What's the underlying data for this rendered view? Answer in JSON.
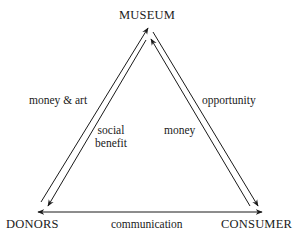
{
  "diagram": {
    "type": "triangle-flow",
    "nodes": {
      "museum": "MUSEUM",
      "donors": "DONORS",
      "consumer": "CONSUMER"
    },
    "edges": [
      {
        "from": "DONORS",
        "to": "MUSEUM",
        "label": "money & art"
      },
      {
        "from": "MUSEUM",
        "to": "DONORS",
        "label_line1": "social",
        "label_line2": "benefit"
      },
      {
        "from": "MUSEUM",
        "to": "CONSUMER",
        "label": "opportunity"
      },
      {
        "from": "CONSUMER",
        "to": "MUSEUM",
        "label": "money"
      },
      {
        "from": "DONORS",
        "to": "CONSUMER",
        "label": "communication",
        "bidirectional": true
      }
    ],
    "colors": {
      "line": "#1a1a1a",
      "background": "#ffffff"
    }
  }
}
